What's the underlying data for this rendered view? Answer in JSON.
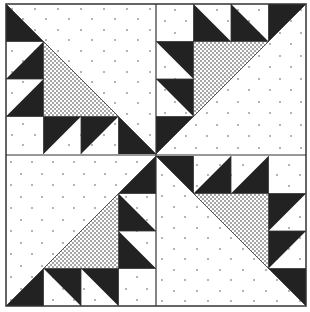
{
  "figure": {
    "colors": {
      "dark": "#222222",
      "light": "#ffffff",
      "border": "#444444",
      "dot": "#555555"
    },
    "grid": {
      "quadrants": 4,
      "cells_per_side": 4
    },
    "quadrants": [
      {
        "name": "top-left",
        "rotation": 0
      },
      {
        "name": "top-right",
        "rotation": 90
      },
      {
        "name": "bottom-right",
        "rotation": 180
      },
      {
        "name": "bottom-left",
        "rotation": 270
      }
    ]
  }
}
